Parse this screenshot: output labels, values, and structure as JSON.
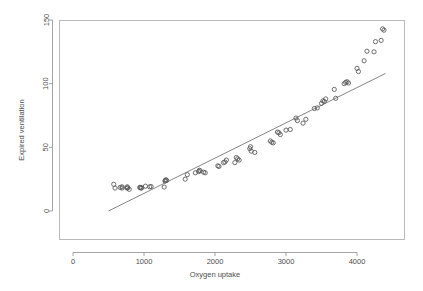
{
  "chart_data": {
    "type": "scatter",
    "title": "",
    "xlabel": "Oxygen uptake",
    "ylabel": "Expired ventilation",
    "xlim": [
      -200,
      4650
    ],
    "ylim": [
      -22,
      152
    ],
    "xticks": [
      0,
      1000,
      2000,
      3000,
      4000
    ],
    "yticks": [
      0,
      50,
      100,
      150
    ],
    "xtick_labels": [
      "0",
      "1000",
      "2000",
      "3000",
      "4000"
    ],
    "ytick_labels": [
      "0",
      "50",
      "100",
      "150"
    ],
    "grid": false,
    "legend": null,
    "point_symbol": "open-circle",
    "series": [
      {
        "name": "observations",
        "x": [
          574,
          592,
          664,
          690,
          692,
          760,
          764,
          770,
          792,
          940,
          950,
          956,
          968,
          1020,
          1080,
          1100,
          1284,
          1296,
          1300,
          1308,
          1320,
          1580,
          1610,
          1724,
          1768,
          1780,
          1792,
          1840,
          1862,
          2040,
          2056,
          2120,
          2140,
          2160,
          2280,
          2300,
          2320,
          2340,
          2490,
          2500,
          2510,
          2560,
          2780,
          2800,
          2820,
          2880,
          2900,
          2920,
          3000,
          3060,
          3140,
          3160,
          3240,
          3280,
          3400,
          3440,
          3500,
          3520,
          3540,
          3560,
          3680,
          3700,
          3820,
          3840,
          3860,
          3880,
          4000,
          4020,
          4100,
          4140,
          4240,
          4260,
          4340,
          4360,
          4380
        ],
        "y": [
          21.0,
          18.0,
          18.5,
          19.0,
          18.0,
          18.0,
          19.0,
          18.2,
          17.0,
          18.5,
          18.5,
          18.0,
          18.2,
          19.5,
          19.0,
          19.2,
          18.8,
          23.5,
          24.0,
          24.5,
          24.0,
          25.0,
          28.5,
          30.0,
          31.0,
          32.0,
          31.5,
          30.5,
          30.0,
          35.5,
          35.0,
          38.0,
          38.5,
          40.0,
          38.0,
          42.0,
          41.0,
          40.0,
          49.0,
          50.5,
          47.0,
          46.0,
          55.0,
          54.0,
          53.5,
          62.0,
          61.5,
          60.0,
          63.5,
          64.0,
          73.0,
          71.0,
          69.0,
          72.0,
          80.5,
          81.0,
          84.5,
          86.5,
          86.0,
          88.0,
          95.5,
          88.5,
          100.0,
          101.0,
          101.5,
          100.5,
          112.0,
          109.5,
          118.0,
          125.5,
          125.0,
          133.0,
          134.0,
          143.0,
          142.0
        ]
      }
    ],
    "fit_line": {
      "name": "linear-fit",
      "x0": 500,
      "y0": 0,
      "x1": 4400,
      "y1": 108
    }
  }
}
